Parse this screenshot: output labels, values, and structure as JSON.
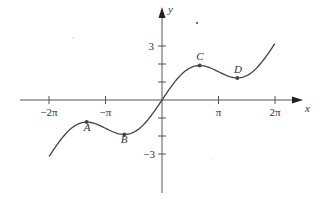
{
  "chart_data": {
    "type": "line",
    "title": "",
    "function": "y = x/2 + sin(x)",
    "xlabel": "x",
    "ylabel": "y",
    "xlim": [
      -6.28,
      6.28
    ],
    "ylim": [
      -3.14,
      3.14
    ],
    "x_ticks": [
      {
        "value": -6.2832,
        "label": "−2π"
      },
      {
        "value": -3.1416,
        "label": "−π"
      },
      {
        "value": 3.1416,
        "label": "π"
      },
      {
        "value": 6.2832,
        "label": "2π"
      }
    ],
    "y_ticks": [
      {
        "value": 3,
        "label": "3"
      },
      {
        "value": 2,
        "label": ""
      },
      {
        "value": 1,
        "label": ""
      },
      {
        "value": -1,
        "label": ""
      },
      {
        "value": -2,
        "label": ""
      },
      {
        "value": -3,
        "label": "−3"
      }
    ],
    "points": [
      {
        "name": "A",
        "x": -4.189,
        "y": -1.228
      },
      {
        "name": "B",
        "x": -2.094,
        "y": -1.913
      },
      {
        "name": "C",
        "x": 2.094,
        "y": 1.913
      },
      {
        "name": "D",
        "x": 4.189,
        "y": 1.228
      }
    ],
    "grid": false,
    "legend": null
  },
  "axes": {
    "x_label": "x",
    "y_label": "y",
    "tick_labels": {
      "neg2pi": "−2π",
      "negpi": "−π",
      "pi": "π",
      "twopi": "2π",
      "y3": "3",
      "yneg3": "−3"
    }
  },
  "points": {
    "A": "A",
    "B": "B",
    "C": "C",
    "D": "D"
  },
  "colors": {
    "curve": "#444444",
    "axis": "#555555",
    "text": "#333333"
  }
}
